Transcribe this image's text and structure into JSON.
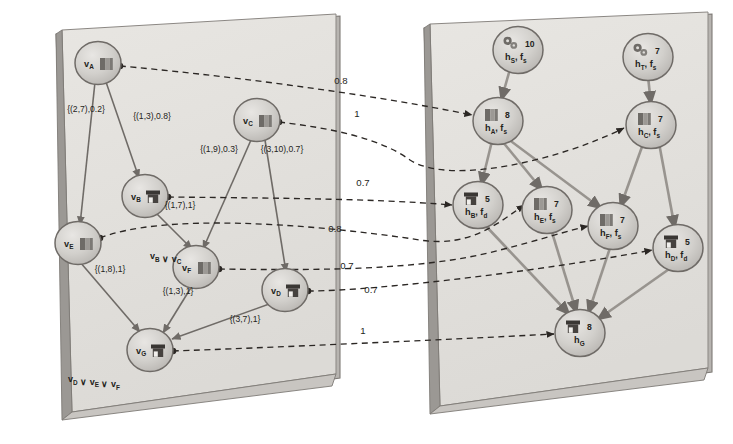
{
  "figure": {
    "kind": "two-panel-graph-mapping-diagram",
    "panels": [
      {
        "id": "left-panel",
        "name": "task-graph-panel",
        "nodes": [
          {
            "id": "vA",
            "label": "v",
            "sub": "A",
            "icon": "book-icon",
            "x": 98,
            "y": 63
          },
          {
            "id": "vC",
            "label": "v",
            "sub": "C",
            "icon": "book-icon",
            "x": 257,
            "y": 120
          },
          {
            "id": "vB",
            "label": "v",
            "sub": "B",
            "icon": "container-icon",
            "x": 145,
            "y": 196
          },
          {
            "id": "vE",
            "label": "v",
            "sub": "E",
            "icon": "book-icon",
            "x": 78,
            "y": 243
          },
          {
            "id": "vF",
            "label": "v",
            "sub": "F",
            "icon": "book-icon",
            "x": 196,
            "y": 267
          },
          {
            "id": "vD",
            "label": "v",
            "sub": "D",
            "icon": "container-icon",
            "x": 285,
            "y": 290
          },
          {
            "id": "vG",
            "label": "v",
            "sub": "G",
            "icon": "container-icon",
            "x": 150,
            "y": 350
          }
        ],
        "edges": [
          {
            "from": "vA",
            "to": "vE",
            "label": "{(2,7),0.2}",
            "lx": 86,
            "ly": 112
          },
          {
            "from": "vA",
            "to": "vB",
            "label": "{(1,3),0.8}",
            "lx": 152,
            "ly": 119
          },
          {
            "from": "vC",
            "to": "vF",
            "label": "{(1,9),0.3}",
            "lx": 219,
            "ly": 152
          },
          {
            "from": "vC",
            "to": "vD",
            "label": "{(3,10),0.7}",
            "lx": 282,
            "ly": 152
          },
          {
            "from": "vB",
            "to": "vF",
            "label": "{(1,7),1}",
            "lx": 180,
            "ly": 208
          },
          {
            "from": "vE",
            "to": "vG",
            "label": "{(1,8),1}",
            "lx": 110,
            "ly": 272
          },
          {
            "from": "vF",
            "to": "vG",
            "label": "{(1,3),1}",
            "lx": 178,
            "ly": 294
          },
          {
            "from": "vD",
            "to": "vG",
            "label": "{(3,7),1}",
            "lx": 245,
            "ly": 322
          }
        ],
        "annotations": [
          {
            "name": "disjunction-vF",
            "text": "v",
            "full": "v_B ∨ v_C",
            "x": 150,
            "y": 259
          },
          {
            "name": "disjunction-vG",
            "text": "v",
            "full": "v_D ∨ v_E ∨ v_F",
            "x": 68,
            "y": 382
          }
        ]
      },
      {
        "id": "right-panel",
        "name": "resource-graph-panel",
        "nodes": [
          {
            "id": "hS",
            "label": "h",
            "sub": "S",
            "fn": "f",
            "fsub": "s",
            "count": "10",
            "icon": "gears-icon",
            "x": 518,
            "y": 50
          },
          {
            "id": "hT",
            "label": "h",
            "sub": "T",
            "fn": "f",
            "fsub": "s",
            "count": "7",
            "icon": "gears-icon",
            "x": 648,
            "y": 57
          },
          {
            "id": "hA",
            "label": "h",
            "sub": "A",
            "fn": "f",
            "fsub": "s",
            "count": "8",
            "icon": "book-icon",
            "x": 498,
            "y": 121
          },
          {
            "id": "hC",
            "label": "h",
            "sub": "C",
            "fn": "f",
            "fsub": "s",
            "count": "7",
            "icon": "book-icon",
            "x": 651,
            "y": 125
          },
          {
            "id": "hB",
            "label": "h",
            "sub": "B",
            "fn": "f",
            "fsub": "d",
            "count": "5",
            "icon": "container-icon",
            "x": 478,
            "y": 205
          },
          {
            "id": "hE",
            "label": "h",
            "sub": "E",
            "fn": "f",
            "fsub": "s",
            "count": "7",
            "icon": "book-icon",
            "x": 547,
            "y": 210
          },
          {
            "id": "hF",
            "label": "h",
            "sub": "F",
            "fn": "f",
            "fsub": "s",
            "count": "7",
            "icon": "book-icon",
            "x": 613,
            "y": 226
          },
          {
            "id": "hD",
            "label": "h",
            "sub": "D",
            "fn": "f",
            "fsub": "d",
            "count": "5",
            "icon": "container-icon",
            "x": 678,
            "y": 248
          },
          {
            "id": "hG",
            "label": "h",
            "sub": "G",
            "fn": "",
            "fsub": "",
            "count": "8",
            "icon": "container-icon",
            "x": 580,
            "y": 333
          }
        ],
        "edges": [
          {
            "from": "hS",
            "to": "hA"
          },
          {
            "from": "hT",
            "to": "hC"
          },
          {
            "from": "hA",
            "to": "hB"
          },
          {
            "from": "hA",
            "to": "hE"
          },
          {
            "from": "hA",
            "to": "hF"
          },
          {
            "from": "hC",
            "to": "hF"
          },
          {
            "from": "hC",
            "to": "hD"
          },
          {
            "from": "hB",
            "to": "hG"
          },
          {
            "from": "hE",
            "to": "hG"
          },
          {
            "from": "hF",
            "to": "hG"
          },
          {
            "from": "hD",
            "to": "hG"
          }
        ]
      }
    ],
    "mappings": [
      {
        "name": "mapping-vA-hA",
        "from": "vA",
        "to": "hA",
        "weight": "0.8",
        "wx": 341,
        "wy": 84
      },
      {
        "name": "mapping-vC-hC",
        "from": "vC",
        "to": "hC",
        "weight": "1",
        "wx": 357,
        "wy": 117
      },
      {
        "name": "mapping-vB-hB",
        "from": "vB",
        "to": "hB",
        "weight": "0.7",
        "wx": 363,
        "wy": 186
      },
      {
        "name": "mapping-vE-hE",
        "from": "vE",
        "to": "hE",
        "weight": "0.8",
        "wx": 335,
        "wy": 232
      },
      {
        "name": "mapping-vF-hF",
        "from": "vF",
        "to": "hF",
        "weight": "0.7",
        "wx": 347,
        "wy": 269
      },
      {
        "name": "mapping-vD-hD",
        "from": "vD",
        "to": "hD",
        "weight": "0.7",
        "wx": 371,
        "wy": 293
      },
      {
        "name": "mapping-vG-hG",
        "from": "vG",
        "to": "hG",
        "weight": "1",
        "wx": 363,
        "wy": 334
      }
    ],
    "colors": {
      "panel_face": "#e2e0dd",
      "panel_edge": "#7e7a76",
      "panel_side": "#a5a19d",
      "node_fill": "#cfcdc9",
      "node_stroke": "#6f6b67",
      "solid_edge": "#8c8884",
      "dashed_edge": "#2b2724",
      "text": "#241f1c"
    }
  }
}
